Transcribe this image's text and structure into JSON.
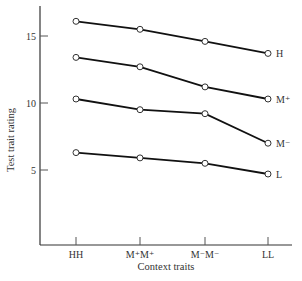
{
  "chart_data": {
    "type": "line",
    "title": "",
    "xlabel": "Context traits",
    "ylabel": "Test trait rating",
    "categories": [
      "HH",
      "M⁺M⁺",
      "M⁻M⁻",
      "LL"
    ],
    "yticks": [
      5,
      10,
      15
    ],
    "ylim": [
      0,
      17.5
    ],
    "grid": false,
    "legend_position": "inline-right",
    "series": [
      {
        "name": "H",
        "values": [
          16.1,
          15.5,
          14.6,
          13.7
        ]
      },
      {
        "name": "M⁺",
        "values": [
          13.4,
          12.7,
          11.2,
          10.3
        ]
      },
      {
        "name": "M⁻",
        "values": [
          10.3,
          9.5,
          9.2,
          7.0
        ]
      },
      {
        "name": "L",
        "values": [
          6.3,
          5.9,
          5.5,
          4.7
        ]
      }
    ]
  }
}
